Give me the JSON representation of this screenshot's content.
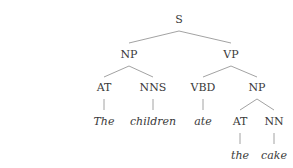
{
  "tree": {
    "label": "S",
    "children": [
      {
        "label": "NP",
        "children": [
          {
            "label": "AT",
            "children": [
              {
                "label": "The",
                "word": true
              }
            ]
          },
          {
            "label": "NNS",
            "children": [
              {
                "label": "children",
                "word": true
              }
            ]
          }
        ]
      },
      {
        "label": "VP",
        "children": [
          {
            "label": "VBD",
            "children": [
              {
                "label": "ate",
                "word": true
              }
            ]
          },
          {
            "label": "NP",
            "children": [
              {
                "label": "AT",
                "children": [
                  {
                    "label": "the",
                    "word": true
                  }
                ]
              },
              {
                "label": "NN",
                "children": [
                  {
                    "label": "cake",
                    "word": true
                  }
                ]
              }
            ]
          }
        ]
      }
    ]
  },
  "nodes": {
    "s": "S",
    "np_subject": "NP",
    "vp": "VP",
    "at_subject": "AT",
    "nns": "NNS",
    "vbd": "VBD",
    "np_object": "NP",
    "at_object": "AT",
    "nn": "NN"
  },
  "words": {
    "the_upper": "The",
    "children": "children",
    "ate": "ate",
    "the_lower": "the",
    "cake": "cake"
  }
}
